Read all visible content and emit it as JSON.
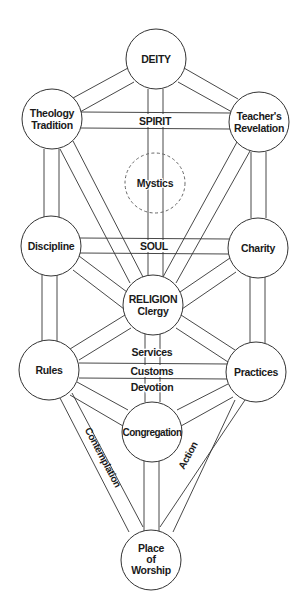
{
  "diagram": {
    "colors": {
      "stroke": "#333333",
      "fill": "#ffffff",
      "text": "#1a1a1a",
      "dashed": "#666666"
    },
    "nodes": [
      {
        "id": "deity",
        "lines": [
          "DEITY"
        ],
        "cx": 156,
        "cy": 59
      },
      {
        "id": "theology",
        "lines": [
          "Theology",
          "Tradition"
        ],
        "cx": 52,
        "cy": 119
      },
      {
        "id": "teachers",
        "lines": [
          "Teacher's",
          "Revelation"
        ],
        "cx": 259,
        "cy": 122
      },
      {
        "id": "mystics",
        "lines": [
          "Mystics"
        ],
        "cx": 155,
        "cy": 183,
        "dashed": true
      },
      {
        "id": "discipline",
        "lines": [
          "Discipline"
        ],
        "cx": 51,
        "cy": 246
      },
      {
        "id": "charity",
        "lines": [
          "Charity"
        ],
        "cx": 258,
        "cy": 248
      },
      {
        "id": "religion",
        "lines": [
          "RELIGION",
          "Clergy"
        ],
        "cx": 153,
        "cy": 305
      },
      {
        "id": "rules",
        "lines": [
          "Rules"
        ],
        "cx": 49,
        "cy": 370
      },
      {
        "id": "practices",
        "lines": [
          "Practices"
        ],
        "cx": 256,
        "cy": 372
      },
      {
        "id": "congregation",
        "lines": [
          "Congregation"
        ],
        "cx": 152,
        "cy": 432
      },
      {
        "id": "worship",
        "lines": [
          "Place",
          "of",
          "Worship"
        ],
        "cx": 151,
        "cy": 560
      }
    ],
    "path_labels": {
      "spirit": "SPIRIT",
      "soul": "SOUL",
      "services": "Services",
      "customs": "Customs",
      "devotion": "Devotion",
      "contemplation": "Contemplation",
      "action": "Action"
    }
  }
}
